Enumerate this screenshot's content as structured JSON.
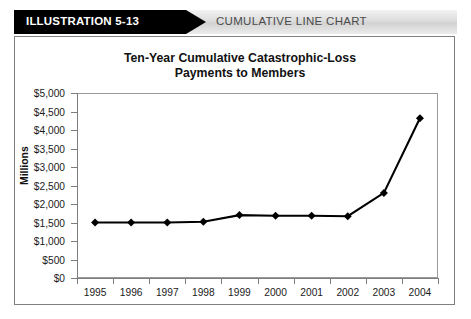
{
  "header": {
    "tab_label": "ILLUSTRATION 5-13",
    "title": "CUMULATIVE LINE CHART",
    "tab_color": "#000000",
    "band_color": "#dcdcdc"
  },
  "chart_data": {
    "type": "line",
    "title": "Ten-Year Cumulative Catastrophic-Loss Payments to Members",
    "title_line1": "Ten-Year Cumulative Catastrophic-Loss",
    "title_line2": "Payments to Members",
    "xlabel": "",
    "ylabel": "Millions",
    "categories": [
      "1995",
      "1996",
      "1997",
      "1998",
      "1999",
      "2000",
      "2001",
      "2002",
      "2003",
      "2004"
    ],
    "values": [
      1500,
      1500,
      1500,
      1520,
      1700,
      1680,
      1680,
      1670,
      2300,
      4320
    ],
    "ylim": [
      0,
      5000
    ],
    "ytick_values": [
      0,
      500,
      1000,
      1500,
      2000,
      2500,
      3000,
      3500,
      4000,
      4500,
      5000
    ],
    "ytick_labels": [
      "$0",
      "$500",
      "$1,000",
      "$1,500",
      "$2,000",
      "$2,500",
      "$3,000",
      "$3,500",
      "$4,000",
      "$4,500",
      "$5,000"
    ],
    "grid": false,
    "legend": false,
    "line_color": "#000000",
    "marker": "diamond",
    "marker_color": "#000000",
    "series": [
      {
        "name": "Cumulative catastrophic-loss payments",
        "values": [
          1500,
          1500,
          1500,
          1520,
          1700,
          1680,
          1680,
          1670,
          2300,
          4320
        ]
      }
    ]
  }
}
